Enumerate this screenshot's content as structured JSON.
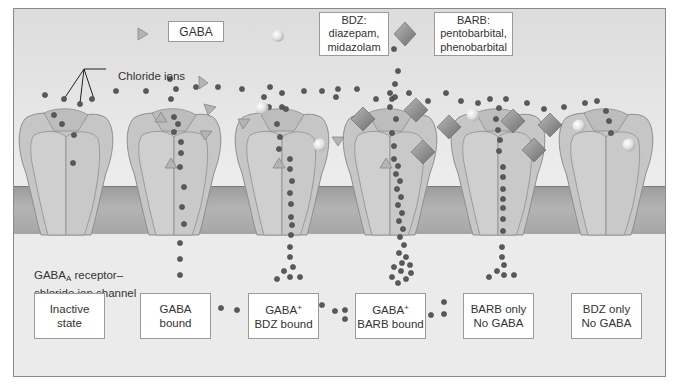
{
  "legend": {
    "gaba": {
      "label": "GABA",
      "symbol": "triangle-icon"
    },
    "bdz": {
      "title": "BDZ:",
      "line1": "diazepam,",
      "line2": "midazolam",
      "symbol": "sphere-icon"
    },
    "barb": {
      "title": "BARB:",
      "line1": "pentobarbital,",
      "line2": "phenobarbital",
      "symbol": "diamond-icon"
    }
  },
  "annotations": {
    "chloride_ions": "Chloride ions",
    "receptor_line1_main": "GABA",
    "receptor_line1_sub": "A",
    "receptor_line1_rest": " receptor–",
    "receptor_line2": "chloride ion channel"
  },
  "states": [
    {
      "line1": "Inactive",
      "line2": "state"
    },
    {
      "line1": "GABA",
      "line2": "bound"
    },
    {
      "line1": "GABA",
      "sup": "+",
      "line2": "BDZ bound"
    },
    {
      "line1": "GABA",
      "sup": "+",
      "line2": "BARB bound"
    },
    {
      "line1": "BARB only",
      "line2": "No GABA"
    },
    {
      "line1": "BDZ only",
      "line2": "No GABA"
    }
  ],
  "colors": {
    "frame_bg": "#e8e8e8",
    "membrane": "#a8a8a8",
    "channel": "#c9c9c9",
    "ion": "#555555",
    "gaba": "#b0b0b0",
    "barb": "#8a8a8a",
    "bdz": "#e6e6e6"
  }
}
